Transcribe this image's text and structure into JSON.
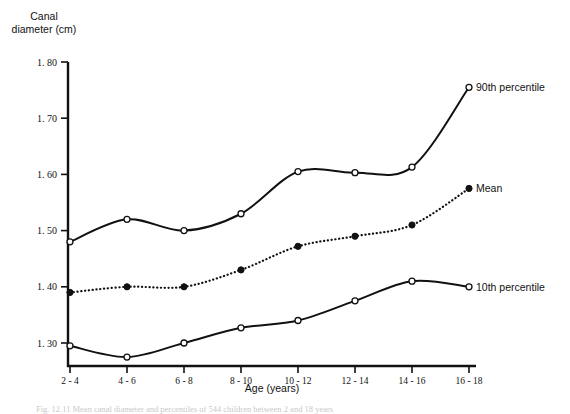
{
  "chart_data": {
    "type": "line",
    "title": "",
    "ylabel": "Canal\ndiameter (cm)",
    "ylabel_line1": "Canal",
    "ylabel_line2": "diameter (cm)",
    "xlabel": "Age (years)",
    "categories": [
      "2 - 4",
      "4 - 6",
      "6 - 8",
      "8 - 10",
      "10 - 12",
      "12 - 14",
      "14 - 16",
      "16 - 18"
    ],
    "ylim": [
      1.25,
      1.8
    ],
    "yticks": [
      1.3,
      1.4,
      1.5,
      1.6,
      1.7,
      1.8
    ],
    "ytick_labels": [
      "1. 30",
      "1. 40",
      "1. 50",
      "1. 60",
      "1. 70",
      "1. 80"
    ],
    "grid": false,
    "legend_position": "right-inline",
    "series": [
      {
        "name": "90th percentile",
        "label": "90th percentile",
        "marker": "open-circle",
        "line_style": "solid",
        "color": "#111111",
        "values": [
          1.48,
          1.52,
          1.5,
          1.53,
          1.605,
          1.603,
          1.613,
          1.755
        ]
      },
      {
        "name": "Mean",
        "label": "Mean",
        "marker": "filled-circle",
        "line_style": "dotted",
        "color": "#111111",
        "values": [
          1.39,
          1.4,
          1.4,
          1.43,
          1.472,
          1.49,
          1.51,
          1.575
        ]
      },
      {
        "name": "10th percentile",
        "label": "10th percentile",
        "marker": "open-circle",
        "line_style": "solid",
        "color": "#111111",
        "values": [
          1.295,
          1.275,
          1.3,
          1.327,
          1.34,
          1.375,
          1.41,
          1.4
        ]
      }
    ]
  },
  "caption": {
    "text": "Fig. 12.11  Mean canal diameter and percentiles of 544 children between 2 and 18 years"
  }
}
